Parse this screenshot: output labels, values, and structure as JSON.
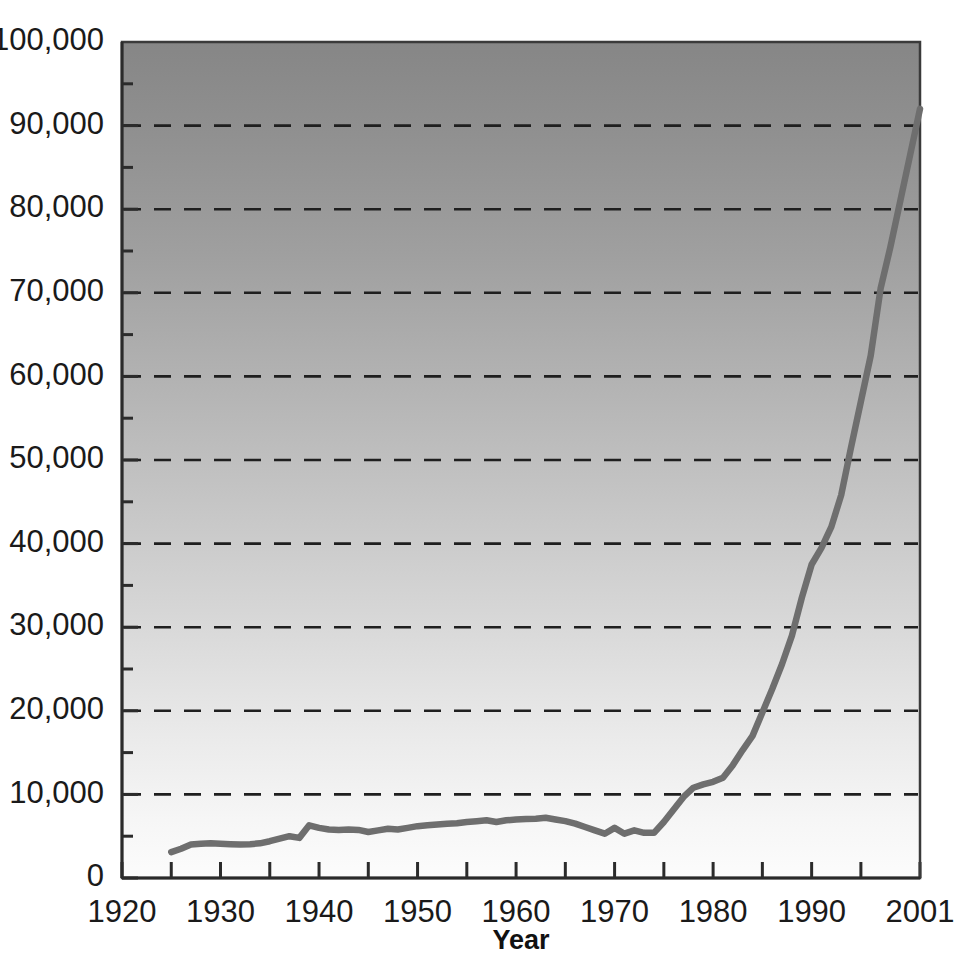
{
  "chart_data": {
    "type": "line",
    "title": "",
    "xlabel": "Year",
    "ylabel": "",
    "xlim": [
      1920,
      2001
    ],
    "ylim": [
      0,
      100000
    ],
    "grid": true,
    "legend": false,
    "legend_position": "none",
    "y_major_step": 10000,
    "y_minor_step": 5000,
    "x_major_step": 10,
    "x_minor_step": 5,
    "line_color": "#6e6e6e",
    "background_gradient_top": "#8a8a8a",
    "background_gradient_bottom": "#fafafa",
    "y_tick_labels": [
      "0",
      "10,000",
      "20,000",
      "30,000",
      "40,000",
      "50,000",
      "60,000",
      "70,000",
      "80,000",
      "90,000",
      "100,000"
    ],
    "y_tick_values": [
      0,
      10000,
      20000,
      30000,
      40000,
      50000,
      60000,
      70000,
      80000,
      90000,
      100000
    ],
    "x_tick_labels": [
      "1920",
      "1930",
      "1940",
      "1950",
      "1960",
      "1970",
      "1980",
      "1990",
      "2001"
    ],
    "x_tick_values": [
      1920,
      1930,
      1940,
      1950,
      1960,
      1970,
      1980,
      1990,
      2001
    ],
    "x_minor_values": [
      1925,
      1935,
      1945,
      1955,
      1965,
      1975,
      1985,
      1995
    ],
    "series": [
      {
        "name": "series-1",
        "color": "#6e6e6e",
        "x": [
          1925,
          1926,
          1927,
          1928,
          1929,
          1930,
          1931,
          1932,
          1933,
          1934,
          1935,
          1936,
          1937,
          1938,
          1939,
          1940,
          1941,
          1942,
          1943,
          1944,
          1945,
          1946,
          1947,
          1948,
          1949,
          1950,
          1951,
          1952,
          1953,
          1954,
          1955,
          1956,
          1957,
          1958,
          1959,
          1960,
          1961,
          1962,
          1963,
          1964,
          1965,
          1966,
          1967,
          1968,
          1969,
          1970,
          1971,
          1972,
          1973,
          1974,
          1975,
          1976,
          1977,
          1978,
          1979,
          1980,
          1981,
          1982,
          1983,
          1984,
          1985,
          1986,
          1987,
          1988,
          1989,
          1990,
          1991,
          1992,
          1993,
          1994,
          1995,
          1996,
          1997,
          1998,
          1999,
          2000,
          2001
        ],
        "values": [
          3100,
          3500,
          4000,
          4100,
          4150,
          4100,
          4050,
          4000,
          4050,
          4150,
          4400,
          4700,
          5000,
          4800,
          6300,
          6000,
          5800,
          5750,
          5800,
          5750,
          5500,
          5700,
          5900,
          5800,
          6000,
          6200,
          6300,
          6400,
          6500,
          6550,
          6700,
          6800,
          6900,
          6700,
          6900,
          7000,
          7050,
          7100,
          7200,
          7000,
          6800,
          6500,
          6100,
          5700,
          5300,
          6000,
          5300,
          5700,
          5400,
          5400,
          6700,
          8200,
          9700,
          10800,
          11200,
          11500,
          12000,
          13500,
          15300,
          17000,
          19800,
          22600,
          25600,
          29000,
          33500,
          37500,
          39500,
          42000,
          45800,
          51500,
          57000,
          62500,
          70500,
          75500,
          81000,
          86500,
          92000
        ]
      }
    ]
  }
}
